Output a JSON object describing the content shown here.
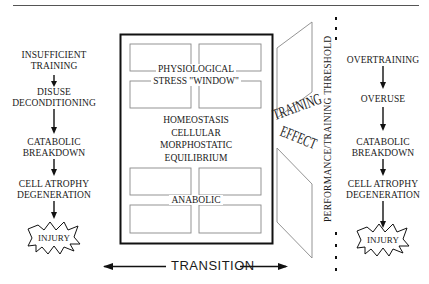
{
  "left_chain": {
    "steps": [
      {
        "line1": "INSUFFICIENT",
        "line2": "TRAINING"
      },
      {
        "line1": "DISUSE",
        "line2": "DECONDITIONING"
      },
      {
        "line1": "CATABOLIC",
        "line2": "BREAKDOWN"
      },
      {
        "line1": "CELL ATROPHY",
        "line2": "DEGENERATION"
      }
    ],
    "end_label": "INJURY"
  },
  "right_chain": {
    "steps": [
      {
        "line1": "OVERTRAINING",
        "line2": ""
      },
      {
        "line1": "OVERUSE",
        "line2": ""
      },
      {
        "line1": "CATABOLIC",
        "line2": "BREAKDOWN"
      },
      {
        "line1": "CELL ATROPHY",
        "line2": "DEGENERATION"
      }
    ],
    "end_label": "INJURY"
  },
  "center_box": {
    "window_line1": "PHYSIOLOGICAL",
    "window_line2": "STRESS \"WINDOW\"",
    "equilibrium_lines": [
      "HOMEOSTASIS",
      "CELLULAR",
      "MORPHOSTATIC",
      "EQUILIBRIUM"
    ],
    "anabolic_label": "ANABOLIC"
  },
  "training_effect": {
    "line1": "TRAINING",
    "line2": "EFFECT"
  },
  "threshold_label": "PERFORMANCE/TRAINING THRESHOLD",
  "transition_label": "TRANSITION",
  "colors": {
    "ink": "#1a1a1a",
    "thin_line": "#777777",
    "rule": "#555555"
  }
}
